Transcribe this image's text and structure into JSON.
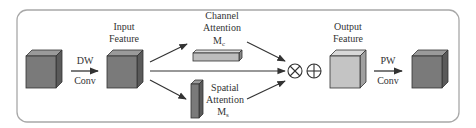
{
  "diagram": {
    "colors": {
      "frame": "#a8a8a8",
      "dark_cube_front": "#7a7a7a",
      "dark_cube_top": "#9a9a9a",
      "dark_cube_side": "#5a5a5a",
      "light_cube_front": "#c4c4c4",
      "light_cube_top": "#d8d8d8",
      "light_cube_side": "#a0a0a0",
      "arrow": "#333333"
    },
    "nodes": {
      "input_feature": {
        "line1": "Input",
        "line2": "Feature"
      },
      "channel_attention": {
        "line1": "Channel",
        "line2": "Attention",
        "symbol": "M",
        "subscript": "c"
      },
      "spatial_attention": {
        "line1": "Spatial",
        "line2": "Attention",
        "symbol": "M",
        "subscript": "s"
      },
      "output_feature": {
        "line1": "Output",
        "line2": "Feature"
      }
    },
    "edges": {
      "dw_conv": {
        "line1": "DW",
        "line2": "Conv"
      },
      "pw_conv": {
        "line1": "PW",
        "line2": "Conv"
      }
    },
    "operators": {
      "multiply": "⊗",
      "add": "⊕"
    }
  }
}
